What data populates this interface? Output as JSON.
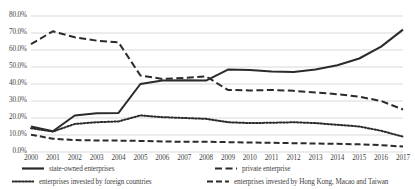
{
  "chart_data": {
    "type": "line",
    "title": "",
    "subtitle": "",
    "xlabel": "",
    "ylabel": "",
    "grid": true,
    "legend_position": "bottom",
    "ylim": [
      0,
      80
    ],
    "ytick_labels": [
      "0.0%",
      "10.0%",
      "20.0%",
      "30.0%",
      "40.0%",
      "50.0%",
      "60.0%",
      "70.0%",
      "80.0%"
    ],
    "ytick_values": [
      0,
      10,
      20,
      30,
      40,
      50,
      60,
      70,
      80
    ],
    "categories": [
      "2000",
      "2001",
      "2002",
      "2003",
      "2004",
      "2005",
      "2006",
      "2007",
      "2008",
      "2009",
      "2010",
      "2011",
      "2012",
      "2013",
      "2014",
      "2015",
      "2016",
      "2017"
    ],
    "x": [
      2000,
      2001,
      2002,
      2003,
      2004,
      2005,
      2006,
      2007,
      2008,
      2009,
      2010,
      2011,
      2012,
      2013,
      2014,
      2015,
      2016,
      2017
    ],
    "series": [
      {
        "name": "state-owned enterprises",
        "style": "solid",
        "color": "#2b2b2b",
        "values": [
          15.0,
          12.2,
          21.5,
          22.8,
          23.0,
          40.0,
          42.0,
          42.2,
          42.0,
          48.5,
          48.3,
          47.3,
          47.0,
          48.5,
          51.0,
          55.0,
          62.0,
          72.0
        ]
      },
      {
        "name": "private enterprise",
        "style": "dashed",
        "color": "#2b2b2b",
        "values": [
          63.5,
          71.0,
          67.5,
          65.5,
          64.5,
          45.0,
          43.0,
          43.5,
          44.5,
          36.5,
          36.2,
          36.5,
          36.0,
          35.0,
          34.0,
          32.5,
          30.0,
          25.0
        ]
      },
      {
        "name": "enterprises invested by foreign countries",
        "style": "dotted",
        "color": "#2b2b2b",
        "values": [
          14.0,
          12.0,
          16.5,
          17.5,
          18.0,
          21.5,
          20.5,
          20.0,
          19.5,
          17.5,
          17.0,
          17.2,
          17.5,
          17.0,
          16.0,
          15.0,
          12.5,
          9.0
        ]
      },
      {
        "name": "enterprises invested by Hong Kong, Macao and Taiwan",
        "style": "long-dashed",
        "color": "#2b2b2b",
        "values": [
          10.2,
          7.8,
          7.0,
          6.8,
          6.7,
          6.5,
          6.2,
          6.0,
          6.0,
          5.8,
          5.6,
          5.4,
          5.2,
          5.0,
          4.8,
          4.5,
          4.0,
          3.2
        ]
      }
    ]
  },
  "legend": {
    "items": [
      {
        "label": "state-owned enterprises",
        "style": "solid"
      },
      {
        "label": "private enterprise",
        "style": "dashed"
      },
      {
        "label": "enterprises invested by foreign countries",
        "style": "dotted"
      },
      {
        "label": "enterprises invested by Hong Kong, Macao and Taiwan",
        "style": "long-dashed"
      }
    ]
  }
}
